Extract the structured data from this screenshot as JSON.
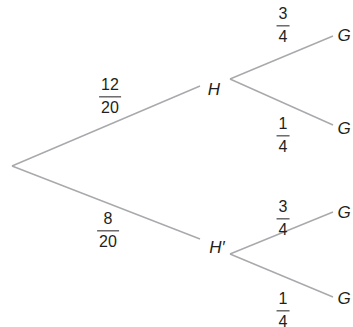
{
  "diagram": {
    "type": "probability-tree",
    "line_color": "#a7a9ac",
    "text_color": "#231f20",
    "root": {
      "x": 12,
      "y": 166
    },
    "first_level": [
      {
        "label": "H",
        "label_pos": {
          "x": 214,
          "y": 89
        },
        "line_end": {
          "x": 200,
          "y": 86
        },
        "branch_start": {
          "x": 230,
          "y": 79
        },
        "probability": {
          "numerator": "12",
          "denominator": "20",
          "pos": {
            "x": 110,
            "y": 97
          }
        },
        "children": [
          {
            "label": "G",
            "label_pos": {
              "x": 344,
              "y": 35
            },
            "line_end": {
              "x": 333,
              "y": 36
            },
            "probability": {
              "numerator": "3",
              "denominator": "4",
              "pos": {
                "x": 283,
                "y": 26
              }
            }
          },
          {
            "label": "G",
            "label_pos": {
              "x": 344,
              "y": 128
            },
            "line_end": {
              "x": 333,
              "y": 125
            },
            "probability": {
              "numerator": "1",
              "denominator": "4",
              "pos": {
                "x": 283,
                "y": 136
              }
            }
          }
        ]
      },
      {
        "label": "H′",
        "label_pos": {
          "x": 217,
          "y": 247
        },
        "line_end": {
          "x": 200,
          "y": 239
        },
        "branch_start": {
          "x": 230,
          "y": 254
        },
        "probability": {
          "numerator": "8",
          "denominator": "20",
          "pos": {
            "x": 108,
            "y": 231
          }
        },
        "children": [
          {
            "label": "G",
            "label_pos": {
              "x": 344,
              "y": 212
            },
            "line_end": {
              "x": 333,
              "y": 212
            },
            "probability": {
              "numerator": "3",
              "denominator": "4",
              "pos": {
                "x": 283,
                "y": 219
              }
            }
          },
          {
            "label": "G",
            "label_pos": {
              "x": 344,
              "y": 298
            },
            "line_end": {
              "x": 333,
              "y": 297
            },
            "probability": {
              "numerator": "1",
              "denominator": "4",
              "pos": {
                "x": 283,
                "y": 311
              }
            }
          }
        ]
      }
    ]
  }
}
